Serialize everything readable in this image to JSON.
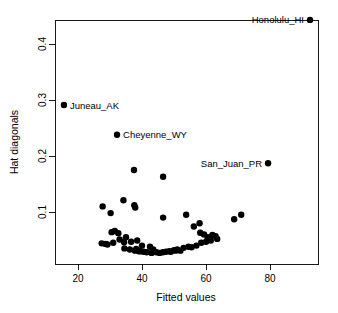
{
  "chart_data": {
    "type": "scatter",
    "title": "",
    "xlabel": "Fitted values",
    "ylabel": "Hat diagonals",
    "xlim": [
      13,
      95
    ],
    "ylim": [
      0.015,
      0.455
    ],
    "grid": false,
    "legend": "none",
    "xticks": [
      20,
      40,
      60,
      80
    ],
    "xtick_labels": [
      "20",
      "40",
      "60",
      "80"
    ],
    "yticks": [
      0.1,
      0.2,
      0.3,
      0.4
    ],
    "ytick_labels": [
      "0.1",
      "0.2",
      "0.3",
      "0.4"
    ],
    "point_color": "#000000",
    "point_size": 3.2,
    "x": [
      92.5,
      15.6,
      32.2,
      79.4,
      37.5,
      46.6,
      34.2,
      37.6,
      37.9,
      27.7,
      30.2,
      46.6,
      53.8,
      58.0,
      68.8,
      71.0,
      56.2,
      63.0,
      62.0,
      60.5,
      58.2,
      59.4,
      30.5,
      31.5,
      32.6,
      35.0,
      36.6,
      38.5,
      27.4,
      28.6,
      33.0,
      34.4,
      40.0,
      42.5,
      29.2,
      31.0,
      34.5,
      36.2,
      37.8,
      39.0,
      40.5,
      41.5,
      43.0,
      44.5,
      45.5,
      46.5,
      47.5,
      48.5,
      50.0,
      51.0,
      52.0,
      53.0,
      54.5,
      55.5,
      57.0,
      58.5,
      60.0,
      61.5,
      63.5,
      38.2,
      39.5,
      43.5,
      49.0,
      50.5
    ],
    "y": [
      0.443,
      0.291,
      0.238,
      0.187,
      0.175,
      0.163,
      0.121,
      0.112,
      0.108,
      0.11,
      0.098,
      0.09,
      0.095,
      0.08,
      0.087,
      0.095,
      0.074,
      0.057,
      0.059,
      0.055,
      0.063,
      0.06,
      0.064,
      0.066,
      0.062,
      0.055,
      0.047,
      0.049,
      0.044,
      0.043,
      0.051,
      0.046,
      0.04,
      0.038,
      0.042,
      0.045,
      0.035,
      0.033,
      0.031,
      0.03,
      0.029,
      0.028,
      0.027,
      0.028,
      0.027,
      0.028,
      0.029,
      0.03,
      0.032,
      0.033,
      0.031,
      0.036,
      0.038,
      0.037,
      0.04,
      0.045,
      0.047,
      0.049,
      0.052,
      0.034,
      0.03,
      0.033,
      0.029,
      0.031
    ],
    "annotations": [
      {
        "label": "Honolulu_HI",
        "x": 92.5,
        "y": 0.443,
        "side": "left"
      },
      {
        "label": "Juneau_AK",
        "x": 15.6,
        "y": 0.291,
        "side": "right"
      },
      {
        "label": "Cheyenne_WY",
        "x": 32.2,
        "y": 0.238,
        "side": "right"
      },
      {
        "label": "San_Juan_PR",
        "x": 79.4,
        "y": 0.187,
        "side": "left"
      }
    ]
  }
}
